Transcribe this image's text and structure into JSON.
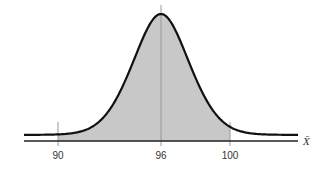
{
  "figure": {
    "type": "normal-distribution-diagram",
    "axis_variable": "X̄",
    "center_value": "96",
    "shaded_region": {
      "from": "90",
      "to": "100"
    },
    "tick_labels": [
      {
        "value": 90,
        "label": "90",
        "x_px": 58
      },
      {
        "value": 96,
        "label": "96",
        "x_px": 161
      },
      {
        "value": 100,
        "label": "100",
        "x_px": 230
      }
    ],
    "colors": {
      "curve": "#111111",
      "shade": "#c8c8c8",
      "axis": "#222222",
      "guide_lines": "#999999",
      "background": "#ffffff"
    }
  }
}
